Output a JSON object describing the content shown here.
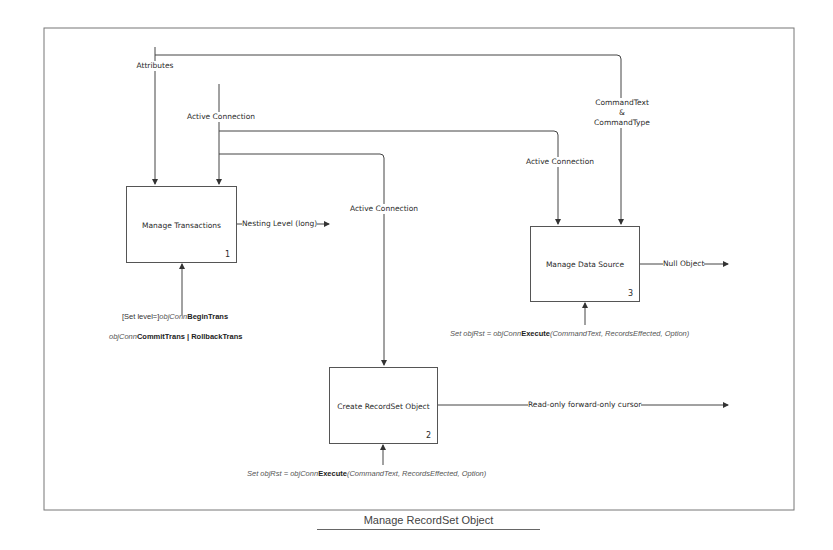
{
  "diagram": {
    "caption": "Manage RecordSet Object",
    "boxes": [
      {
        "title": "Manage Transactions",
        "number": "1"
      },
      {
        "title": "Create RecordSet Object",
        "number": "2"
      },
      {
        "title": "Manage Data Source",
        "number": "3"
      }
    ],
    "labels": {
      "attributes": "Attributes",
      "active_connection_1": "Active Connection",
      "active_connection_2": "Active Connection",
      "active_connection_3": "Active Connection",
      "command_text": "CommandText",
      "ampersand": "&",
      "command_type": "CommandType",
      "nesting_level": "Nesting Level (long)",
      "null_object": "Null Object",
      "read_only_cursor": "Read-only forward-only cursor"
    },
    "code": {
      "begin_trans": {
        "prefix": "[Set level=]",
        "obj": "objConn",
        "method": "BeginTrans"
      },
      "commit_trans": {
        "obj": "objConn",
        "method": "CommitTrans | RollbackTrans"
      },
      "execute_box3": {
        "prefix": "Set ",
        "var": "objRst",
        "eq": " = ",
        "obj": "objConn",
        "method": "Execute",
        "args": "(CommandText, RecordsEffected, Option)"
      },
      "execute_box2": {
        "prefix": "Set ",
        "var": "objRst",
        "eq": " = ",
        "obj": "objConn",
        "method": "Execute",
        "args": "(CommandText, RecordsEffected, Option)"
      }
    },
    "colors": {
      "line": "#444444",
      "frame": "#666666",
      "background": "#ffffff"
    }
  }
}
